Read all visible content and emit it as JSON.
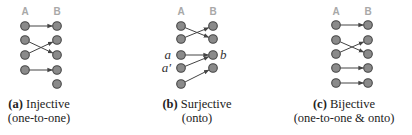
{
  "colors": {
    "node_fill": "#8a8a8a",
    "node_stroke": "#444444",
    "edge": "#444444",
    "header": "#a8a8a8"
  },
  "panels": [
    {
      "id": "a",
      "set_a_label": "A",
      "set_b_label": "B",
      "a_count": 4,
      "b_count": 5,
      "edges": [
        [
          0,
          0
        ],
        [
          1,
          2
        ],
        [
          2,
          1
        ],
        [
          3,
          3
        ]
      ],
      "point_labels": [],
      "caption_tag": "(a)",
      "caption_title": "Injective",
      "caption_sub": "(one-to-one)"
    },
    {
      "id": "b",
      "set_a_label": "A",
      "set_b_label": "B",
      "a_count": 5,
      "b_count": 4,
      "edges": [
        [
          0,
          1
        ],
        [
          1,
          0
        ],
        [
          2,
          2
        ],
        [
          3,
          2
        ],
        [
          4,
          3
        ]
      ],
      "point_labels": [
        {
          "side": "A",
          "index": 2,
          "text": "a"
        },
        {
          "side": "A",
          "index": 3,
          "text": "a′"
        },
        {
          "side": "B",
          "index": 2,
          "text": "b"
        }
      ],
      "caption_tag": "(b)",
      "caption_title": "Surjective",
      "caption_sub": "(onto)"
    },
    {
      "id": "c",
      "set_a_label": "A",
      "set_b_label": "B",
      "a_count": 5,
      "b_count": 5,
      "edges": [
        [
          0,
          0
        ],
        [
          1,
          2
        ],
        [
          2,
          1
        ],
        [
          3,
          3
        ],
        [
          4,
          4
        ]
      ],
      "point_labels": [],
      "caption_tag": "(c)",
      "caption_title": "Bijective",
      "caption_sub": "(one-to-one & onto)"
    }
  ]
}
